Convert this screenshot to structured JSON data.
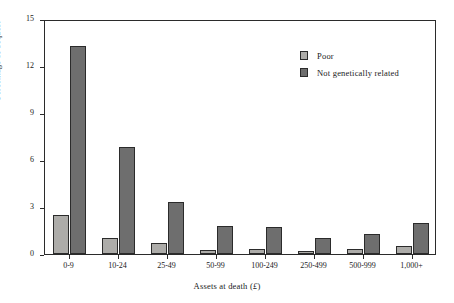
{
  "chart_data": {
    "type": "bar",
    "title": "",
    "subtitle": "",
    "xlabel": "Assets at death (£)",
    "xlabel_text": "Assets at death (",
    "xlabel_currency": "£",
    "xlabel_suffix": ")",
    "ylabel": "Percentage of bequest",
    "categories": [
      "0-9",
      "10-24",
      "25-49",
      "50-99",
      "100-249",
      "250-499",
      "500-999",
      "1,000+"
    ],
    "series": [
      {
        "name": "Poor",
        "color": "#adaca9",
        "values": [
          2.5,
          1.0,
          0.7,
          0.25,
          0.3,
          0.2,
          0.3,
          0.5
        ]
      },
      {
        "name": "Not genetically related",
        "color": "#6e6e6e",
        "values": [
          13.3,
          6.8,
          3.3,
          1.8,
          1.75,
          1.0,
          1.3,
          2.0
        ]
      }
    ],
    "ylim": [
      0,
      15
    ],
    "yticks": [
      0,
      3,
      6,
      9,
      12,
      15
    ],
    "ytick_labels": [
      "0",
      "3",
      "6",
      "9",
      "12",
      "15"
    ],
    "grid": false,
    "legend_position": "top-right"
  },
  "legend": {
    "items": [
      {
        "label": "Poor",
        "swatch": "poor"
      },
      {
        "label": "Not genetically related",
        "swatch": "notrel"
      }
    ]
  },
  "colors": {
    "poor": "#adaca9",
    "not_genetically_related": "#6e6e6e",
    "axis": "#2b2b2b",
    "background": "#ffffff"
  }
}
